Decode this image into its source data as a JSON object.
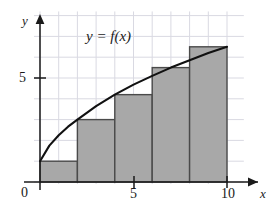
{
  "figure": {
    "name": "riemann-sum-left-endpoint-figure",
    "background_color": "#ffffff",
    "grid_color": "#d9d9e2",
    "axis_color": "#1a1a1a",
    "bar_fill_color": "#a8a8a8",
    "bar_stroke_color": "#4a4a4a",
    "curve_color": "#111111"
  },
  "labels": {
    "y_axis": "y",
    "x_axis": "x",
    "origin": "0",
    "y_tick_5": "5",
    "x_tick_5": "5",
    "x_tick_10": "10",
    "curve_equation": "y = f(x)"
  },
  "chart_data": {
    "type": "bar",
    "title": "",
    "xlabel": "x",
    "ylabel": "y",
    "xlim": [
      0,
      10.9
    ],
    "ylim": [
      0,
      8.2
    ],
    "xticks": [
      0,
      5,
      10
    ],
    "xticklabels": [
      "0",
      "5",
      "10"
    ],
    "yticks": [
      5
    ],
    "yticklabels": [
      "5"
    ],
    "grid": true,
    "grid_spacing_x": 1,
    "grid_spacing_y": 1,
    "legend": null,
    "annotations": [
      {
        "text": "y = f(x)",
        "x": 3.9,
        "y": 7.0,
        "style": "italic"
      }
    ],
    "bars": {
      "method": "left-endpoint rectangles",
      "width": 2,
      "edges": [
        0,
        2,
        4,
        6,
        8,
        10
      ],
      "left_x": [
        0,
        2,
        4,
        6,
        8
      ],
      "values": [
        1.0,
        3.0,
        4.2,
        5.5,
        6.5
      ]
    },
    "series": [
      {
        "name": "f(x)",
        "type": "line",
        "x": [
          0,
          0.5,
          1,
          1.5,
          2,
          3,
          4,
          5,
          6,
          7,
          8,
          9,
          10
        ],
        "y": [
          1.0,
          1.75,
          2.25,
          2.66,
          3.0,
          3.65,
          4.2,
          4.68,
          5.1,
          5.5,
          5.85,
          6.2,
          6.5
        ]
      }
    ]
  }
}
